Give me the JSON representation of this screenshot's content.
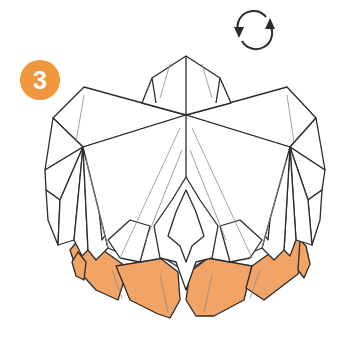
{
  "diagram": {
    "type": "origami-step",
    "step": {
      "number": "3",
      "badge_color": "#f0963c"
    },
    "instruction_icon": {
      "name": "rotate-icon",
      "meaning": "turn the model over"
    },
    "colors": {
      "paper_front": "#ffffff",
      "paper_back": "#f2a466",
      "line": "#2b2b2b",
      "crease": "#8a8a8a"
    }
  }
}
